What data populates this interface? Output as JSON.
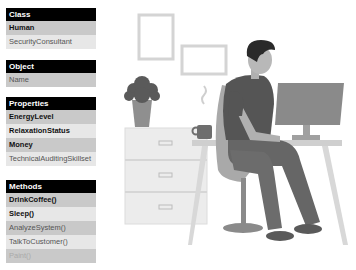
{
  "panels": {
    "class": {
      "header": "Class",
      "rows": [
        {
          "label": "Human",
          "style": "bold",
          "shade": "dark"
        },
        {
          "label": "SecurityConsultant",
          "style": "normal",
          "shade": "light"
        }
      ]
    },
    "object": {
      "header": "Object",
      "rows": [
        {
          "label": "Name",
          "style": "normal",
          "shade": "dark"
        }
      ]
    },
    "properties": {
      "header": "Properties",
      "rows": [
        {
          "label": "EnergyLevel",
          "style": "bold",
          "shade": "dark"
        },
        {
          "label": "RelaxationStatus",
          "style": "bold",
          "shade": "light"
        },
        {
          "label": "Money",
          "style": "bold",
          "shade": "dark"
        },
        {
          "label": "TechnicalAuditingSkillset",
          "style": "normal",
          "shade": "light"
        }
      ]
    },
    "methods": {
      "header": "Methods",
      "rows": [
        {
          "label": "DrinkCoffee()",
          "style": "bold",
          "shade": "dark"
        },
        {
          "label": "Sleep()",
          "style": "bold",
          "shade": "light"
        },
        {
          "label": "AnalyzeSystem()",
          "style": "normal",
          "shade": "dark"
        },
        {
          "label": "TalkToCustomer()",
          "style": "normal",
          "shade": "light"
        },
        {
          "label": "Paint()",
          "style": "faded",
          "shade": "dark"
        }
      ]
    }
  },
  "illustration": {
    "subject": "person working at desk with computer",
    "colors": {
      "shirt": "#555555",
      "pants": "#666666",
      "monitor": "#8a8a8a",
      "desk": "#cfcfcf",
      "cabinet": "#ececec",
      "frame": "#d4d4d4",
      "plant": "#5a5a5a",
      "pot": "#8f8f8f",
      "chair": "#a9a9a9",
      "skin": "#b0b0b0",
      "hair": "#2a2a2a"
    }
  }
}
